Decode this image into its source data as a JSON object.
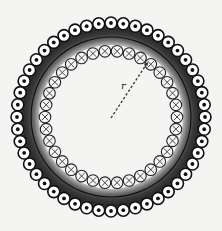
{
  "diagram": {
    "center": [
      111,
      117
    ],
    "outer_ring": {
      "radius": 94,
      "count": 48,
      "symbol": "dot",
      "meaning": "current out of page"
    },
    "inner_ring": {
      "radius": 66,
      "count": 34,
      "symbol": "cross",
      "meaning": "current into page"
    },
    "band": {
      "outer_radius": 90,
      "inner_radius": 72,
      "line_radius": 80
    },
    "radius_line": {
      "from": [
        111,
        118
      ],
      "to": [
        148,
        62
      ],
      "style": "dashed"
    },
    "label": {
      "text": "r",
      "x": 121,
      "y": 80
    },
    "colors": {
      "background": "#f4f4f2",
      "band_dark": "#2a2a2a",
      "band_light": "#cfcfcf",
      "stroke": "#111111",
      "symbol_fill": "#ffffff"
    }
  }
}
